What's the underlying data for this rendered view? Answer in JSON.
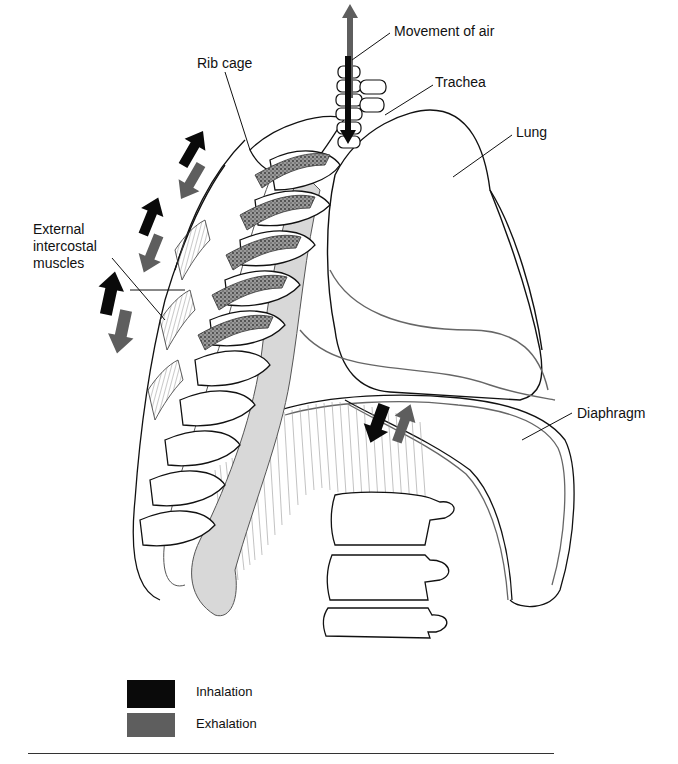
{
  "labels": {
    "movement_of_air": "Movement of air",
    "trachea": "Trachea",
    "rib_cage": "Rib cage",
    "lung": "Lung",
    "external_intercostal_muscles": "External\nintercostal\nmuscles",
    "diaphragm": "Diaphragm"
  },
  "legend": {
    "items": [
      {
        "label": "Inhalation",
        "color": "#0a0a0a"
      },
      {
        "label": "Exhalation",
        "color": "#5e5e5e"
      }
    ]
  },
  "colors": {
    "inhalation_arrow": "#0a0a0a",
    "exhalation_arrow": "#5e5e5e",
    "outline": "#111111",
    "shaded_bone": "#d8d8d8",
    "stipple": "#555555"
  }
}
